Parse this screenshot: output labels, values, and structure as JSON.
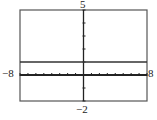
{
  "chart_data": {
    "type": "line",
    "title": "",
    "xlabel": "",
    "ylabel": "",
    "xlim": [
      -8,
      8
    ],
    "ylim": [
      -2,
      5
    ],
    "xscale": 1,
    "yscale": 1,
    "grid": false,
    "legend": null,
    "tick_labels": {
      "xmin": "−8",
      "xmax": "8",
      "ymin": "−2",
      "ymax": "5"
    },
    "series": [
      {
        "name": "y = 1",
        "x": [
          -8,
          8
        ],
        "y": [
          1,
          1
        ]
      }
    ]
  },
  "colors": {
    "frame": "#555555",
    "axis": "#222222",
    "line": "#333333"
  }
}
